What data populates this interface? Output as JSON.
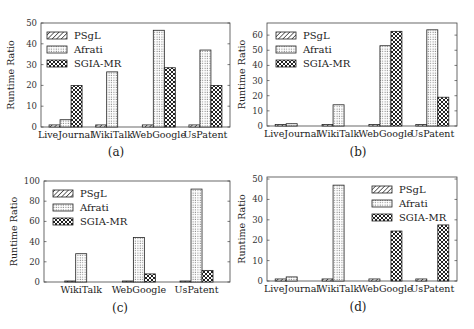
{
  "figure": {
    "legend_entries": [
      "PSgL",
      "Afrati",
      "SGIA-MR"
    ],
    "patterns": {
      "PSgL": "diagonal-hatch",
      "Afrati": "dots",
      "SGIA-MR": "crosshatch"
    }
  },
  "chart_data": [
    {
      "type": "bar",
      "caption": "(a)",
      "title": "",
      "xlabel": "",
      "ylabel": "Runtime Ratio",
      "categories": [
        "LiveJournal",
        "WikiTalk",
        "WebGoogle",
        "UsPatent"
      ],
      "series": [
        {
          "name": "PSgL",
          "values": [
            1,
            1,
            1,
            1
          ]
        },
        {
          "name": "Afrati",
          "values": [
            3.5,
            26.5,
            46.5,
            37
          ]
        },
        {
          "name": "SGIA-MR",
          "values": [
            20,
            null,
            28.5,
            20
          ]
        }
      ],
      "ylim": [
        0,
        50
      ],
      "yticks": [
        0,
        10,
        20,
        30,
        40,
        50
      ],
      "grid": false,
      "legend_position": "upper left"
    },
    {
      "type": "bar",
      "caption": "(b)",
      "title": "",
      "xlabel": "",
      "ylabel": "Runtime Ratio",
      "categories": [
        "LiveJournal",
        "WikiTalk",
        "WebGoogle",
        "UsPatent"
      ],
      "series": [
        {
          "name": "PSgL",
          "values": [
            1,
            1,
            1,
            1
          ]
        },
        {
          "name": "Afrati",
          "values": [
            1.5,
            14,
            53,
            63.5
          ]
        },
        {
          "name": "SGIA-MR",
          "values": [
            null,
            null,
            62.5,
            19
          ]
        }
      ],
      "ylim": [
        0,
        68
      ],
      "yticks": [
        0,
        10,
        20,
        30,
        40,
        50,
        60
      ],
      "grid": false,
      "legend_position": "upper left"
    },
    {
      "type": "bar",
      "caption": "(c)",
      "title": "",
      "xlabel": "",
      "ylabel": "Runtime Ratio",
      "categories": [
        "WikiTalk",
        "WebGoogle",
        "UsPatent"
      ],
      "series": [
        {
          "name": "PSgL",
          "values": [
            1,
            1,
            1
          ]
        },
        {
          "name": "Afrati",
          "values": [
            28,
            44,
            92
          ]
        },
        {
          "name": "SGIA-MR",
          "values": [
            null,
            8,
            11.5
          ]
        }
      ],
      "ylim": [
        0,
        100
      ],
      "yticks": [
        0,
        20,
        40,
        60,
        80,
        100
      ],
      "grid": false,
      "legend_position": "upper left"
    },
    {
      "type": "bar",
      "caption": "(d)",
      "title": "",
      "xlabel": "",
      "ylabel": "Runtime Ratio",
      "categories": [
        "LiveJournal",
        "WikiTalk",
        "WebGoogle",
        "UsPatent"
      ],
      "series": [
        {
          "name": "PSgL",
          "values": [
            1,
            1,
            1,
            1
          ]
        },
        {
          "name": "Afrati",
          "values": [
            2,
            47,
            null,
            null
          ]
        },
        {
          "name": "SGIA-MR",
          "values": [
            null,
            null,
            24.5,
            27.5
          ]
        }
      ],
      "ylim": [
        0,
        51
      ],
      "yticks": [
        0,
        10,
        20,
        30,
        40,
        50
      ],
      "grid": false,
      "legend_position": "upper right"
    }
  ]
}
